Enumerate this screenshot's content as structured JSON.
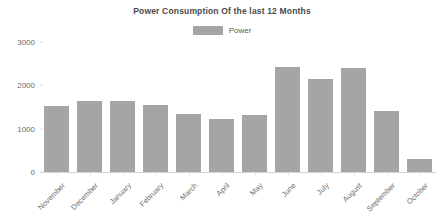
{
  "chart_data": {
    "type": "bar",
    "title": "Power Consumption Of the last 12 Months",
    "xlabel": "",
    "ylabel": "",
    "categories": [
      "November",
      "December",
      "January",
      "February",
      "March",
      "April",
      "May",
      "June",
      "July",
      "August",
      "September",
      "October"
    ],
    "series": [
      {
        "name": "Power",
        "color": "#a5a5a5",
        "values": [
          1530,
          1640,
          1650,
          1540,
          1330,
          1230,
          1320,
          2420,
          2150,
          2390,
          1400,
          300
        ]
      }
    ],
    "values": [
      1530,
      1640,
      1650,
      1540,
      1330,
      1230,
      1320,
      2420,
      2150,
      2390,
      1400,
      300
    ],
    "ylim": [
      0,
      3000
    ],
    "yticks": [
      0,
      1000,
      2000,
      3000
    ],
    "ytick_labels": [
      "0",
      "1000",
      "2000",
      "3000"
    ],
    "grid": false,
    "legend": {
      "position": "top-center",
      "entries": [
        {
          "label": "Power",
          "color": "#a5a5a5"
        }
      ]
    },
    "axis_color": "#d4d4d4",
    "tick_label_color": "#6b6b6b",
    "title_color": "#4a4a4a",
    "background": "#ffffff"
  }
}
